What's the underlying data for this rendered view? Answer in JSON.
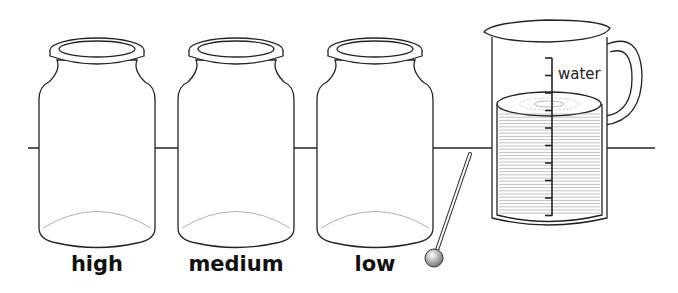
{
  "jars": [
    {
      "label": "high",
      "cx": 97
    },
    {
      "label": "medium",
      "cx": 236
    },
    {
      "label": "low",
      "cx": 375
    }
  ],
  "jug": {
    "scale_label": "water",
    "scale_ticks": 10
  },
  "stirrer": {
    "name": "thermometer-stirrer"
  },
  "colors": {
    "stroke": "#222222",
    "water_lines": "#888888",
    "background": "#ffffff"
  }
}
